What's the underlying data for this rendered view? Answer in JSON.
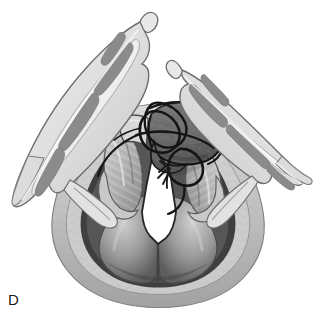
{
  "figure": {
    "panel_label": "D",
    "domain": "medical-illustration",
    "view": "endoscopic-laryngeal-view",
    "background_color": "#ffffff",
    "width": 316,
    "height": 324
  },
  "palette": {
    "background": "#ffffff",
    "outline_dark": "#2b2b2b",
    "suture_black": "#141414",
    "cartilage_gray": "#8d8d8d",
    "cartilage_gray_dark": "#7a7a7a",
    "flap_pale": "#d6d6d6",
    "flap_pale_light": "#e6e6e6",
    "graft_gray": "#6e6e6e",
    "graft_gray_dark": "#5a5a5a",
    "tongue_mid": "#9a9a9a",
    "tongue_dark": "#4a4a4a",
    "mucosa_light": "#c4c4c4",
    "airway_white": "#ffffff",
    "shadow_deep": "#3a3a3a",
    "label_color": "#1a1a1a"
  },
  "structures": {
    "left_wing": {
      "name": "Left retracted lateral flap",
      "fill": "#e0e0e0",
      "stroke": "#6a6a6a",
      "cartilage_segments": 4,
      "cartilage_fill": "#8d8d8d"
    },
    "right_wing": {
      "name": "Right retracted lateral flap",
      "fill": "#e0e0e0",
      "stroke": "#6a6a6a",
      "cartilage_segments": 4,
      "cartilage_fill": "#8d8d8d"
    },
    "graft": {
      "name": "Sutured graft tissue",
      "fill": "#6e6e6e",
      "stroke": "#141414",
      "texture": "mottled"
    },
    "sutures": {
      "name": "Suture loops and knots",
      "color": "#141414",
      "loop_count": 3,
      "thread_tails": 4
    },
    "airway": {
      "name": "Glottic airway opening",
      "fill": "#ffffff",
      "stroke": "#2b2b2b",
      "shape": "wedge"
    },
    "tongue_base": {
      "name": "Tongue base / vallecula",
      "fill": "#9a9a9a",
      "stroke": "#3a3a3a"
    },
    "epiglottic_folds": {
      "name": "Aryepiglottic folds",
      "fill": "#bdbdbd",
      "stroke": "#5a5a5a",
      "striations": 9
    }
  }
}
